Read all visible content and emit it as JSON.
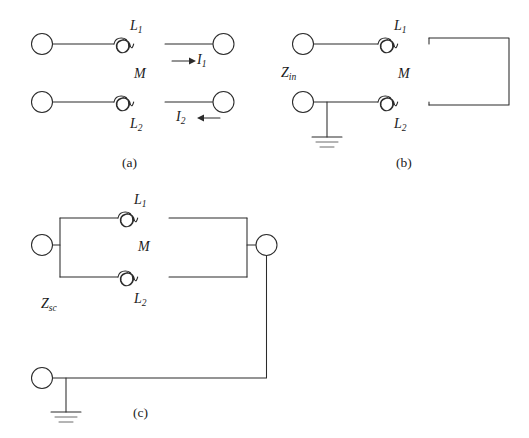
{
  "figure": {
    "background_color": "#ffffff",
    "line_color": "#2b2b2b",
    "panels": [
      {
        "id": "a",
        "caption": "(a)",
        "labels": {
          "l1": "L",
          "l1_sub": "1",
          "l2": "L",
          "l2_sub": "2",
          "m": "M",
          "i1": "I",
          "i1_sub": "1",
          "i2": "I",
          "i2_sub": "2"
        },
        "elements": [
          "terminal-top-left",
          "terminal-top-right",
          "terminal-bottom-left",
          "terminal-bottom-right",
          "inductor-l1",
          "inductor-l2",
          "current-arrow-i1",
          "current-arrow-i2"
        ]
      },
      {
        "id": "b",
        "caption": "(b)",
        "labels": {
          "l1": "L",
          "l1_sub": "1",
          "l2": "L",
          "l2_sub": "2",
          "m": "M",
          "z": "Z",
          "z_sub": "in"
        },
        "elements": [
          "terminal-top-left",
          "terminal-bottom-left",
          "inductor-l1",
          "inductor-l2",
          "shorting-wire-right",
          "ground-symbol"
        ]
      },
      {
        "id": "c",
        "caption": "(c)",
        "labels": {
          "l1": "L",
          "l1_sub": "1",
          "l2": "L",
          "l2_sub": "2",
          "m": "M",
          "z": "Z",
          "z_sub": "sc"
        },
        "elements": [
          "terminal-left-upper",
          "terminal-right-upper",
          "terminal-left-lower",
          "inductor-l1",
          "inductor-l2",
          "parallel-branch-wires",
          "return-wire",
          "ground-symbol"
        ]
      }
    ]
  }
}
